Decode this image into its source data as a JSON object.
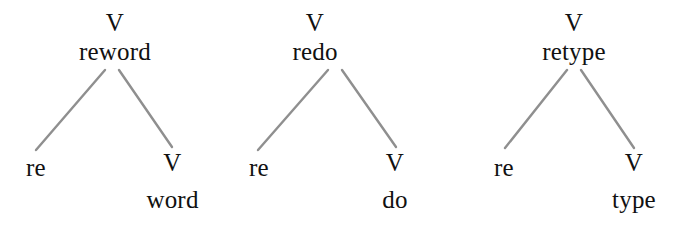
{
  "figure": {
    "background_color": "#ffffff",
    "text_color": "#111111",
    "branch_color": "#8f8f8f"
  },
  "trees": [
    {
      "root": {
        "category": "V",
        "form": "reword"
      },
      "left_child": {
        "form": "re"
      },
      "right_child": {
        "category": "V",
        "form": "word"
      }
    },
    {
      "root": {
        "category": "V",
        "form": "redo"
      },
      "left_child": {
        "form": "re"
      },
      "right_child": {
        "category": "V",
        "form": "do"
      }
    },
    {
      "root": {
        "category": "V",
        "form": "retype"
      },
      "left_child": {
        "form": "re"
      },
      "right_child": {
        "category": "V",
        "form": "type"
      }
    }
  ]
}
